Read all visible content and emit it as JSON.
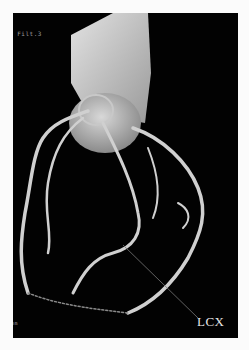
{
  "image": {
    "description": "3D volume-rendered coronary CT angiography of the heart showing coronary arteries",
    "overlay_top_left": "e Filt.3",
    "overlay_bottom_left": "mm",
    "annotation_label": "LCX",
    "colors": {
      "background": "#020202",
      "border": "#fbfbfb",
      "vessel": "#d9d9d9",
      "label": "#e8e8e8"
    }
  }
}
